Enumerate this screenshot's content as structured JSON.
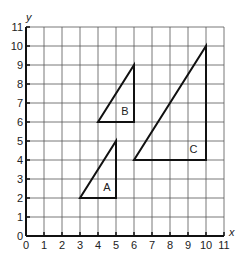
{
  "diagram": {
    "x_axis_label": "x",
    "y_axis_label": "y",
    "x_range": [
      0,
      11
    ],
    "y_range": [
      0,
      11
    ],
    "x_ticks": [
      "0",
      "1",
      "2",
      "3",
      "4",
      "5",
      "6",
      "7",
      "8",
      "9",
      "10",
      "11"
    ],
    "y_ticks": [
      "0",
      "1",
      "2",
      "3",
      "4",
      "5",
      "6",
      "7",
      "8",
      "9",
      "10",
      "11"
    ],
    "grid": true,
    "shapes": [
      {
        "label": "A",
        "vertices": [
          [
            3,
            2
          ],
          [
            5,
            2
          ],
          [
            5,
            5
          ]
        ],
        "label_pos": [
          4.5,
          2.6
        ]
      },
      {
        "label": "B",
        "vertices": [
          [
            4,
            6
          ],
          [
            6,
            6
          ],
          [
            6,
            9
          ]
        ],
        "label_pos": [
          5.5,
          6.6
        ]
      },
      {
        "label": "C",
        "vertices": [
          [
            6,
            4
          ],
          [
            10,
            4
          ],
          [
            10,
            10
          ]
        ],
        "label_pos": [
          9.3,
          4.6
        ]
      }
    ],
    "colors": {
      "grid": "#555555",
      "shape": "#111111",
      "background": "#ffffff"
    }
  }
}
